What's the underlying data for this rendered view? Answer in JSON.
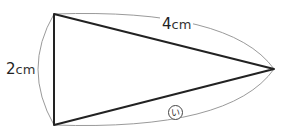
{
  "figure": {
    "type": "isosceles-triangle-with-arc-dimensions",
    "vertices": {
      "top_left": [
        54,
        14
      ],
      "bottom_left": [
        54,
        125
      ],
      "right": [
        274,
        69
      ]
    },
    "labels": {
      "short_side_value": "2",
      "short_side_unit": "cm",
      "long_side_value": "4",
      "long_side_unit": "cm",
      "unknown_side_mark": "い"
    },
    "colors": {
      "triangle_stroke": "#222222",
      "arc_stroke": "#999999",
      "text": "#222222"
    }
  }
}
